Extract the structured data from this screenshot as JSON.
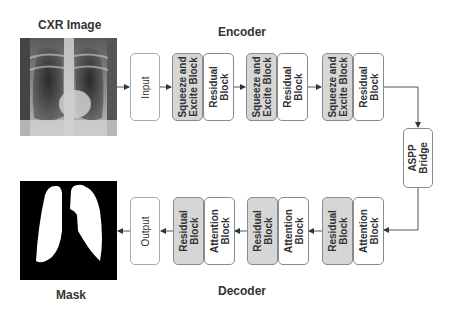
{
  "diagram": {
    "input_image_title": "CXR Image",
    "output_image_title": "Mask",
    "encoder_title": "Encoder",
    "decoder_title": "Decoder",
    "input_node": "Input",
    "output_node": "Output",
    "encoder_stages": [
      {
        "se": "Squeeze and\nExcite Block",
        "res": "Residual\nBlock"
      },
      {
        "se": "Squeeze and\nExcite Block",
        "res": "Residual\nBlock"
      },
      {
        "se": "Squeeze and\nExcite Block",
        "res": "Residual\nBlock"
      }
    ],
    "bridge": "ASPP\nBridge",
    "decoder_stages": [
      {
        "res": "Residual\nBlock",
        "att": "Attention\nBlock"
      },
      {
        "res": "Residual\nBlock",
        "att": "Attention\nBlock"
      },
      {
        "res": "Residual\nBlock",
        "att": "Attention\nBlock"
      }
    ],
    "colors": {
      "gray_block": "#d6d6d6",
      "border": "#8a8a8a",
      "arrow": "#333333"
    }
  }
}
